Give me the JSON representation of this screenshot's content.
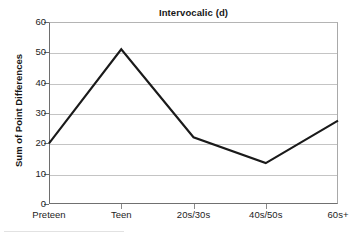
{
  "chart_data": {
    "type": "line",
    "title": "Intervocalic (d)",
    "xlabel": "",
    "ylabel": "Sum of Point Differences",
    "categories": [
      "Preteen",
      "Teen",
      "20s/30s",
      "40s/50s",
      "60s+"
    ],
    "values": [
      20,
      51,
      22,
      13.5,
      27.5
    ],
    "series": [
      {
        "name": "Sum of Point Differences",
        "values": [
          20,
          51,
          22,
          13.5,
          27.5
        ]
      }
    ],
    "ylim": [
      0,
      60
    ],
    "yticks": [
      0,
      10,
      20,
      30,
      40,
      50,
      60
    ],
    "ytick_labels": [
      "0",
      "10",
      "20",
      "30",
      "40",
      "50",
      "60"
    ],
    "grid": "horizontal",
    "legend": "none",
    "markers": "none",
    "line_color": "#1a1a1a",
    "gridline_color": "#c4c4c4",
    "background_color": "#ffffff"
  }
}
